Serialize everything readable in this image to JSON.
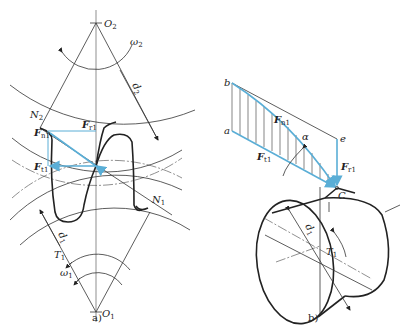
{
  "figure": {
    "panel_a": {
      "caption": "a)",
      "labels": {
        "O2": "O",
        "O2_sub": "2",
        "O1": "O",
        "O1_sub": "1",
        "omega2": "ω",
        "omega2_sub": "2",
        "omega1": "ω",
        "omega1_sub": "1",
        "N2": "N",
        "N2_sub": "2",
        "N1": "N",
        "N1_sub": "1",
        "T1": "T",
        "T1_sub": "1",
        "d2": "d",
        "d2_sub": "2",
        "d1": "d",
        "d1_sub": "1",
        "Fn1": "F",
        "Fn1_sub": "n1",
        "Fr1": "F",
        "Fr1_sub": "r1",
        "Ft1": "F",
        "Ft1_sub": "t1"
      }
    },
    "panel_b": {
      "caption": "b)",
      "labels": {
        "a": "a",
        "b": "b",
        "e": "e",
        "C": "C",
        "alpha": "α",
        "Fn1": "F",
        "Fn1_sub": "n1",
        "Ft1": "F",
        "Ft1_sub": "t1",
        "Fr1": "F",
        "Fr1_sub": "r1",
        "d1": "d",
        "d1_sub": "1",
        "T1": "T",
        "T1_sub": "1"
      }
    },
    "colors": {
      "force_vector": "#5aaed6",
      "line": "#333333",
      "background": "#ffffff"
    }
  }
}
